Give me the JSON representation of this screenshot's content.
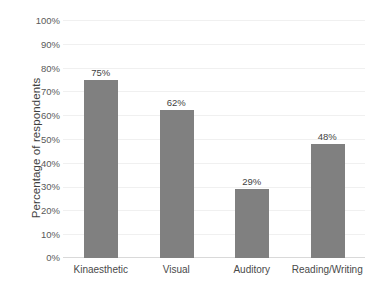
{
  "chart_data": {
    "type": "bar",
    "title": "",
    "subtitle": "",
    "xlabel": "",
    "ylabel": "Percentage of respondents",
    "categories": [
      "Kinaesthetic",
      "Visual",
      "Auditory",
      "Reading/Writing"
    ],
    "values": [
      75,
      62,
      29,
      48
    ],
    "data_labels": [
      "75%",
      "62%",
      "29%",
      "48%"
    ],
    "ylim": [
      0,
      100
    ],
    "y_ticks": [
      0,
      10,
      20,
      30,
      40,
      50,
      60,
      70,
      80,
      90,
      100
    ],
    "y_tick_labels": [
      "0%",
      "10%",
      "20%",
      "30%",
      "40%",
      "50%",
      "60%",
      "70%",
      "80%",
      "90%",
      "100%"
    ],
    "grid": true,
    "grid_axis": "y",
    "legend": false,
    "legend_position": "none",
    "series": [
      {
        "name": "Percentage of respondents",
        "values": [
          75,
          62,
          29,
          48
        ],
        "color": "#808080"
      }
    ],
    "colors": {
      "bar": "#808080",
      "background": "#ffffff",
      "gridline": "#f0f0f0",
      "axis_line": "#d9d9d9",
      "tick_label": "#5a5a5a",
      "data_label": "#3f3f3f",
      "axis_title": "#3f3f3f",
      "category_label": "#4a4a4a"
    }
  }
}
